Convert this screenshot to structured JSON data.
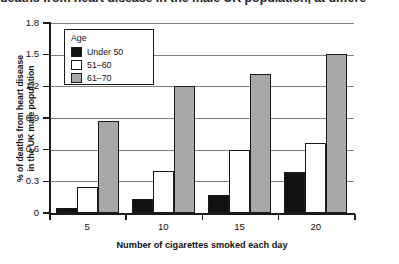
{
  "caption": {
    "text": "deaths from heart disease in the male UK population, at differe"
  },
  "chart_data": {
    "type": "bar",
    "title": "",
    "xlabel": "Number of cigarettes smoked each day",
    "ylabel_lines": [
      "% of deaths from heart disease",
      "in the UK male population"
    ],
    "ylabel": "% of deaths from heart disease in the UK male population",
    "categories": [
      "5",
      "10",
      "15",
      "20"
    ],
    "series": [
      {
        "name": "Under 50",
        "color": "#111111",
        "values": [
          0.05,
          0.13,
          0.17,
          0.39
        ]
      },
      {
        "name": "51–60",
        "color": "#ffffff",
        "values": [
          0.25,
          0.4,
          0.6,
          0.66
        ]
      },
      {
        "name": "61–70",
        "color": "#a8a8a8",
        "values": [
          0.87,
          1.2,
          1.32,
          1.51
        ]
      }
    ],
    "ylim": [
      0,
      1.8
    ],
    "yticks": [
      "0",
      "0.3",
      "0.6",
      "0.9",
      "1.2",
      "1.5",
      "1.8"
    ],
    "ytick_values": [
      0,
      0.3,
      0.6,
      0.9,
      1.2,
      1.5,
      1.8
    ],
    "xticks": [
      "5",
      "10",
      "15",
      "20"
    ],
    "grid": "horizontal",
    "legend": {
      "title": "Age",
      "position": "inside-top-left",
      "entries": [
        "Under 50",
        "51–60",
        "61–70"
      ]
    }
  }
}
